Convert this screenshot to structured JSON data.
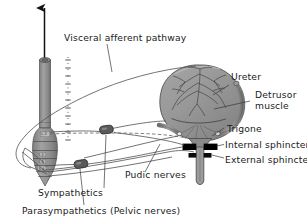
{
  "figure": {
    "background": "#ffffff"
  },
  "labels": {
    "visceral_afferent": "Visceral afferent pathway",
    "ureter": "Ureter",
    "detrusor_line1": "Detrusor",
    "detrusor_line2": "muscle",
    "trigone": "Trigone",
    "internal_sphincter": "Internal sphincter",
    "external_sphincter": "External sphincter",
    "pudic_nerves": "Pudic nerves",
    "sympathetics": "Sympathetics",
    "parasympathetics": "Parasympathetics (Pelvic nerves)"
  },
  "spinal_segments": [
    {
      "id": "seg-l2",
      "label": "L 2"
    },
    {
      "id": "seg-s2",
      "label": "S 2"
    },
    {
      "id": "seg-s3",
      "label": "S 3"
    },
    {
      "id": "seg-s4",
      "label": "S 4"
    }
  ],
  "structures": {
    "spinal_cord": "spinal-cord",
    "bladder": "urinary-bladder",
    "urethra": "urethra",
    "ureter_tube": "ureter-tube",
    "sympathetic_chain": "sympathetic-chain",
    "ganglion_upper": "sympathetic-ganglion",
    "ganglion_lower": "pelvic-ganglion",
    "ascending_arrow": "ascending-tract-arrow"
  },
  "colors": {
    "organ_fill": "#8f8f8f",
    "organ_fill_light": "#9c9c9c",
    "cord_fill": "#939393",
    "outline": "#4a4a4a",
    "nerve": "#5a5a5a",
    "text": "#1a1a1a",
    "sphincter": "#000000",
    "background": "#ffffff"
  }
}
